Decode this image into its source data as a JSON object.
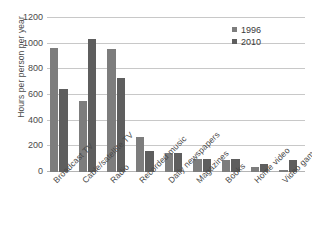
{
  "chart_data": {
    "type": "bar",
    "title": "",
    "xlabel": "",
    "ylabel": "Hours per person per year",
    "ylim": [
      0,
      1200
    ],
    "yticks": [
      0,
      200,
      400,
      600,
      800,
      1000,
      1200
    ],
    "ytick_labels": [
      "0",
      "200",
      "400",
      "600",
      "800",
      "1000",
      "1200"
    ],
    "grid": true,
    "legend_position": "top-right",
    "categories": [
      "Broadcast TV",
      "Cable/satellite TV",
      "Radio",
      "Recorded music",
      "Daily newspapers",
      "Magazines",
      "Books",
      "Home video",
      "Video games"
    ],
    "series": [
      {
        "name": "1996",
        "color": "#7d7d7d",
        "values": [
          965,
          555,
          955,
          275,
          150,
          100,
          90,
          40,
          15
        ]
      },
      {
        "name": "2010",
        "color": "#5e5e5e",
        "values": [
          650,
          1035,
          735,
          165,
          145,
          100,
          100,
          60,
          90
        ]
      }
    ]
  },
  "colors": {
    "series_1996": "#7d7d7d",
    "series_2010": "#5e5e5e",
    "gridline": "#c8c8c8",
    "axis": "#b4b4b4",
    "text": "#4a4a4a",
    "background": "#ffffff"
  }
}
